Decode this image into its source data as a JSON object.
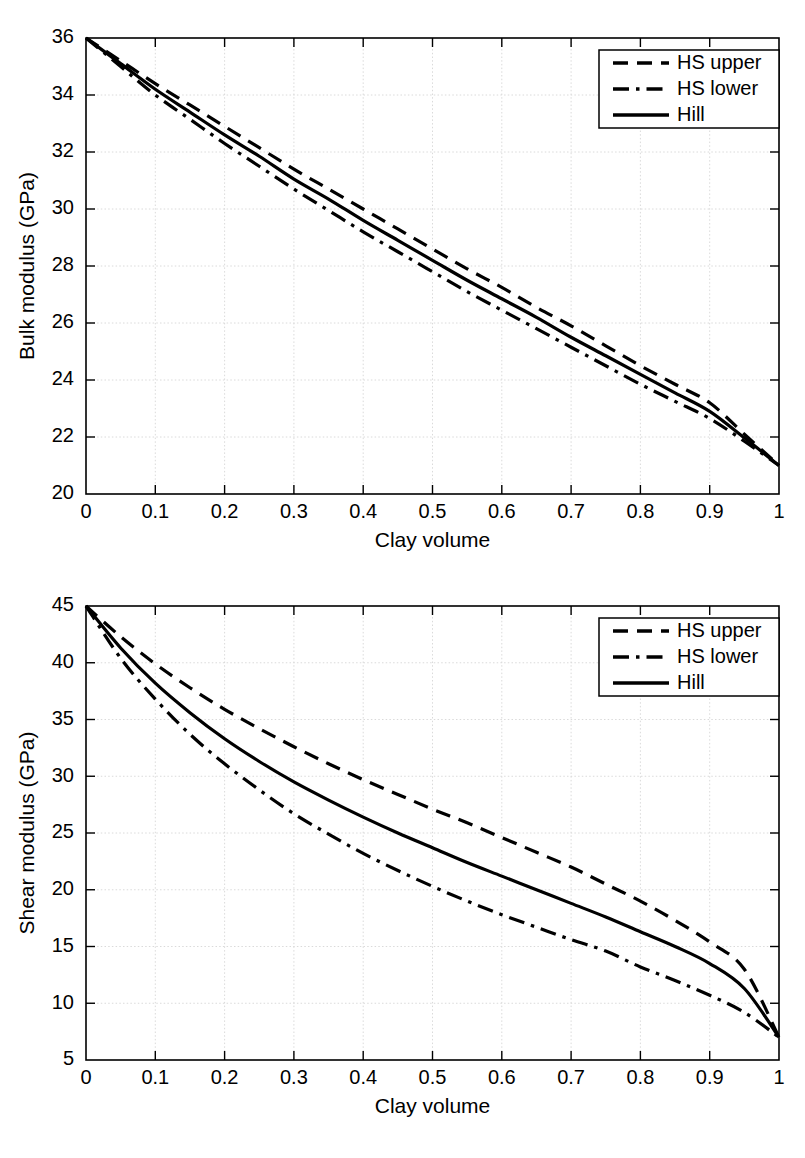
{
  "figure": {
    "background_color": "#ffffff",
    "line_color": "#000000",
    "grid_color": "#d6d6d6"
  },
  "chart_data": [
    {
      "id": "bulk-modulus-chart",
      "type": "line",
      "title": "",
      "xlabel": "Clay volume",
      "ylabel": "Bulk modulus (GPa)",
      "xlim": [
        0,
        1
      ],
      "ylim": [
        20,
        36
      ],
      "xticks": [
        0,
        0.1,
        0.2,
        0.3,
        0.4,
        0.5,
        0.6,
        0.7,
        0.8,
        0.9,
        1
      ],
      "xticklabels": [
        "0",
        "0.1",
        "0.2",
        "0.3",
        "0.4",
        "0.5",
        "0.6",
        "0.7",
        "0.8",
        "0.9",
        "1"
      ],
      "yticks": [
        20,
        22,
        24,
        26,
        28,
        30,
        32,
        34,
        36
      ],
      "yticklabels": [
        "20",
        "22",
        "24",
        "26",
        "28",
        "30",
        "32",
        "34",
        "36"
      ],
      "grid": true,
      "legend_position": "upper right",
      "x": [
        0,
        0.05,
        0.1,
        0.15,
        0.2,
        0.25,
        0.3,
        0.35,
        0.4,
        0.45,
        0.5,
        0.55,
        0.6,
        0.65,
        0.7,
        0.75,
        0.8,
        0.85,
        0.9,
        0.95,
        1
      ],
      "series": [
        {
          "name": "HS upper",
          "style": "dashed",
          "values": [
            36.0,
            35.2,
            34.4,
            33.65,
            32.9,
            32.15,
            31.4,
            30.7,
            30.0,
            29.3,
            28.6,
            27.9,
            27.25,
            26.55,
            25.9,
            25.2,
            24.5,
            23.85,
            23.2,
            22.1,
            21.0
          ]
        },
        {
          "name": "HS lower",
          "style": "dashdot",
          "values": [
            36.0,
            35.0,
            34.0,
            33.15,
            32.3,
            31.5,
            30.7,
            29.95,
            29.2,
            28.5,
            27.8,
            27.1,
            26.45,
            25.8,
            25.15,
            24.5,
            23.85,
            23.25,
            22.65,
            21.85,
            21.0
          ]
        },
        {
          "name": "Hill",
          "style": "solid",
          "values": [
            36.0,
            35.1,
            34.2,
            33.4,
            32.6,
            31.85,
            31.05,
            30.35,
            29.6,
            28.9,
            28.2,
            27.5,
            26.85,
            26.2,
            25.5,
            24.85,
            24.2,
            23.55,
            22.9,
            21.97,
            21.0
          ]
        }
      ]
    },
    {
      "id": "shear-modulus-chart",
      "type": "line",
      "title": "",
      "xlabel": "Clay volume",
      "ylabel": "Shear modulus (GPa)",
      "xlim": [
        0,
        1
      ],
      "ylim": [
        5,
        45
      ],
      "xticks": [
        0,
        0.1,
        0.2,
        0.3,
        0.4,
        0.5,
        0.6,
        0.7,
        0.8,
        0.9,
        1
      ],
      "xticklabels": [
        "0",
        "0.1",
        "0.2",
        "0.3",
        "0.4",
        "0.5",
        "0.6",
        "0.7",
        "0.8",
        "0.9",
        "1"
      ],
      "yticks": [
        5,
        10,
        15,
        20,
        25,
        30,
        35,
        40,
        45
      ],
      "yticklabels": [
        "5",
        "10",
        "15",
        "20",
        "25",
        "30",
        "35",
        "40",
        "45"
      ],
      "grid": true,
      "legend_position": "upper right",
      "x": [
        0,
        0.05,
        0.1,
        0.15,
        0.2,
        0.25,
        0.3,
        0.35,
        0.4,
        0.45,
        0.5,
        0.55,
        0.6,
        0.65,
        0.7,
        0.75,
        0.8,
        0.85,
        0.9,
        0.95,
        1
      ],
      "series": [
        {
          "name": "HS upper",
          "style": "dashed",
          "values": [
            45.0,
            42.3,
            39.9,
            37.8,
            35.9,
            34.2,
            32.6,
            31.1,
            29.7,
            28.4,
            27.1,
            25.9,
            24.6,
            23.3,
            22.0,
            20.5,
            19.0,
            17.3,
            15.4,
            13.0,
            7.0
          ]
        },
        {
          "name": "HS lower",
          "style": "dashdot",
          "values": [
            45.0,
            40.4,
            36.8,
            33.7,
            31.1,
            28.8,
            26.7,
            24.9,
            23.2,
            21.7,
            20.3,
            19.0,
            17.8,
            16.7,
            15.6,
            14.6,
            13.2,
            12.0,
            10.7,
            9.2,
            7.0
          ]
        },
        {
          "name": "Hill",
          "style": "solid",
          "values": [
            45.0,
            41.3,
            38.2,
            35.6,
            33.3,
            31.3,
            29.5,
            27.9,
            26.4,
            25.0,
            23.7,
            22.4,
            21.2,
            20.0,
            18.8,
            17.6,
            16.3,
            15.0,
            13.5,
            11.3,
            7.0
          ]
        }
      ]
    }
  ],
  "legend": {
    "items": [
      {
        "label": "HS upper",
        "style": "dashed"
      },
      {
        "label": "HS lower",
        "style": "dashdot"
      },
      {
        "label": "Hill",
        "style": "solid"
      }
    ]
  }
}
